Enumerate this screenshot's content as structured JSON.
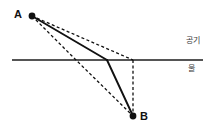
{
  "diagram": {
    "type": "optics-refraction-diagram",
    "title": "",
    "width": 215,
    "height": 131,
    "background_color": "#ffffff",
    "media": {
      "upper": {
        "name": "air",
        "label": "공기",
        "label_x": 186,
        "label_y": 37,
        "color": "#3a3a3a"
      },
      "lower": {
        "name": "water",
        "label": "물",
        "label_x": 188,
        "label_y": 65,
        "color": "#3a3a3a"
      }
    },
    "interface": {
      "name": "water-surface-line",
      "x1": 12,
      "y1": 60,
      "x2": 203,
      "y2": 60,
      "color": "#555555",
      "stroke_width": 1.6
    },
    "points": [
      {
        "id": "A",
        "label": "A",
        "x": 32,
        "y": 16,
        "radius": 3.4,
        "color": "#111111",
        "label_x": 14,
        "label_y": 9
      },
      {
        "id": "B",
        "label": "B",
        "x": 133,
        "y": 116,
        "radius": 3.4,
        "color": "#111111",
        "label_x": 140,
        "label_y": 111
      }
    ],
    "bend_point": {
      "name": "refraction-point",
      "x": 107,
      "y": 60
    },
    "aux_surface_points": [
      {
        "name": "vertical-drop-surface-point",
        "x": 133,
        "y": 60
      },
      {
        "name": "straight-chord-surface-point",
        "x": 76,
        "y": 60
      }
    ],
    "paths": [
      {
        "name": "incident-ray-solid",
        "style": "solid",
        "color": "#111111",
        "stroke_width": 1.9,
        "points": [
          [
            32,
            16
          ],
          [
            107,
            60
          ]
        ]
      },
      {
        "name": "refracted-ray-solid",
        "style": "solid",
        "color": "#111111",
        "stroke_width": 1.9,
        "points": [
          [
            107,
            60
          ],
          [
            133,
            116
          ]
        ]
      },
      {
        "name": "undeviated-extension-dashed",
        "style": "dashed",
        "color": "#111111",
        "stroke_width": 1.3,
        "dash": "3,2.4",
        "points": [
          [
            32,
            16
          ],
          [
            133,
            60
          ]
        ]
      },
      {
        "name": "vertical-drop-dashed",
        "style": "dashed",
        "color": "#111111",
        "stroke_width": 1.3,
        "dash": "3,2.4",
        "points": [
          [
            133,
            60
          ],
          [
            133,
            116
          ]
        ]
      },
      {
        "name": "straight-line-A-to-B-dashed",
        "style": "dashed",
        "color": "#111111",
        "stroke_width": 1.3,
        "dash": "3,2.4",
        "points": [
          [
            32,
            16
          ],
          [
            76,
            60
          ],
          [
            133,
            116
          ]
        ]
      }
    ]
  }
}
